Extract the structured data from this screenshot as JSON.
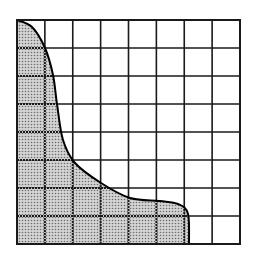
{
  "diagram": {
    "type": "grid-with-shaded-region",
    "grid": {
      "columns": 8,
      "rows": 8,
      "left": 17,
      "top": 20,
      "right": 240,
      "bottom": 244,
      "line_color": "#1a1a1a",
      "background": "#ffffff"
    },
    "shaded_region": {
      "description": "Dotted region bounded by left edge, bottom edge, and a curve descending from the top-left corner to a vertical drop near column 6",
      "fill_color": "#b8b8b8",
      "dot_color": "#6e6e6e",
      "curve_points": [
        [
          17,
          20
        ],
        [
          32,
          27
        ],
        [
          45,
          48
        ],
        [
          53,
          75
        ],
        [
          57,
          104
        ],
        [
          63,
          140
        ],
        [
          75,
          163
        ],
        [
          101,
          183
        ],
        [
          130,
          198
        ],
        [
          160,
          201
        ],
        [
          178,
          204
        ],
        [
          188,
          214
        ],
        [
          189,
          244
        ]
      ],
      "boundary_color": "#000000"
    }
  }
}
